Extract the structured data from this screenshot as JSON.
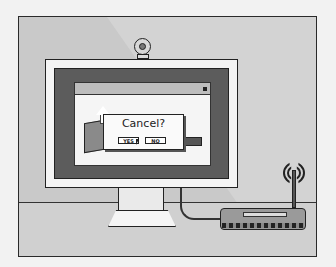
{
  "illustration": {
    "subject": "Desktop monitor showing a confirmation dialog, with webcam on top and a wireless router connected by cable",
    "palette": {
      "background": "#f2f2f2",
      "scene": "#c9c9c9",
      "outline": "#222222",
      "bezel": "#5c5c5c",
      "screen": "#f5f5f5"
    }
  },
  "dialog": {
    "title": "Cancel?",
    "yes_label": "YES",
    "no_label": "NO"
  },
  "icons": {
    "webcam": "webcam-icon",
    "package": "box-upload-icon",
    "cursor": "mouse-pointer-icon",
    "router": "wifi-router-icon",
    "signal": "wifi-signal-icon"
  }
}
